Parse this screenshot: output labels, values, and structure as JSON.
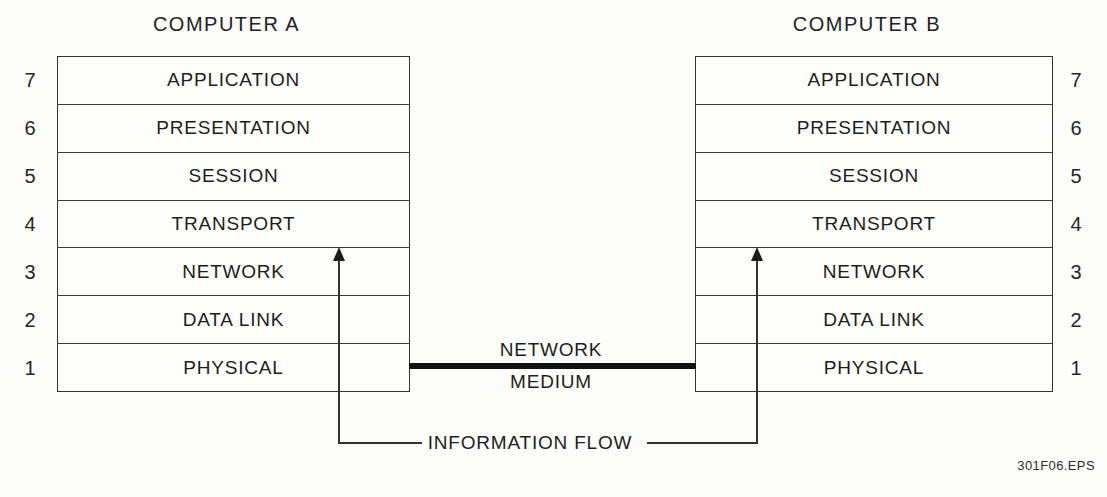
{
  "diagram": {
    "computer_a": {
      "title": "COMPUTER A"
    },
    "computer_b": {
      "title": "COMPUTER B"
    },
    "layers": [
      {
        "number": "7",
        "label": "APPLICATION"
      },
      {
        "number": "6",
        "label": "PRESENTATION"
      },
      {
        "number": "5",
        "label": "SESSION"
      },
      {
        "number": "4",
        "label": "TRANSPORT"
      },
      {
        "number": "3",
        "label": "NETWORK"
      },
      {
        "number": "2",
        "label": "DATA LINK"
      },
      {
        "number": "1",
        "label": "PHYSICAL"
      }
    ],
    "network_medium": {
      "line1": "NETWORK",
      "line2": "MEDIUM"
    },
    "information_flow": {
      "label": "INFORMATION FLOW"
    },
    "footer": {
      "filename": "301F06.EPS"
    },
    "colors": {
      "line": "#333333",
      "text": "#1d1d1d",
      "medium_line": "#121212",
      "background": "#fcfcfb"
    }
  }
}
